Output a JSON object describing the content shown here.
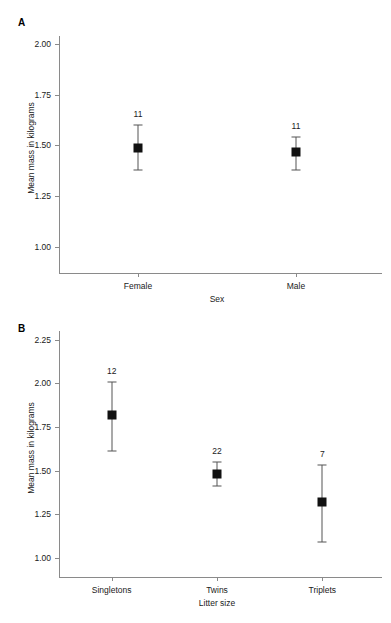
{
  "figure": {
    "background_color": "#ffffff",
    "marker_color": "#111111",
    "error_bar_color": "#555555",
    "axis_color": "#8a8a8a"
  },
  "chart_data": [
    {
      "type": "scatter",
      "panel_label": "A",
      "title": "",
      "xlabel": "Sex",
      "ylabel": "Mean mass in kilograms",
      "categories": [
        "Female",
        "Male"
      ],
      "values": [
        1.49,
        1.47
      ],
      "error_low": [
        1.38,
        1.38
      ],
      "error_high": [
        1.6,
        1.54
      ],
      "point_labels": [
        "11",
        "11"
      ],
      "yticks": [
        "1.00",
        "1.25",
        "1.50",
        "1.75",
        "2.00"
      ],
      "ytick_values": [
        1.0,
        1.25,
        1.5,
        1.75,
        2.0
      ],
      "ylim": [
        0.94,
        2.04
      ],
      "grid": false,
      "legend": "none"
    },
    {
      "type": "scatter",
      "panel_label": "B",
      "title": "",
      "xlabel": "Litter size",
      "ylabel": "Mean mass in kilograms",
      "categories": [
        "Singletons",
        "Twins",
        "Triplets"
      ],
      "values": [
        1.82,
        1.48,
        1.32
      ],
      "error_low": [
        1.61,
        1.41,
        1.09
      ],
      "error_high": [
        2.01,
        1.55,
        1.53
      ],
      "point_labels": [
        "12",
        "22",
        "7"
      ],
      "yticks": [
        "1.00",
        "1.25",
        "1.50",
        "1.75",
        "2.00",
        "2.25"
      ],
      "ytick_values": [
        1.0,
        1.25,
        1.5,
        1.75,
        2.0,
        2.25
      ],
      "ylim": [
        0.96,
        2.3
      ],
      "grid": false,
      "legend": "none"
    }
  ]
}
